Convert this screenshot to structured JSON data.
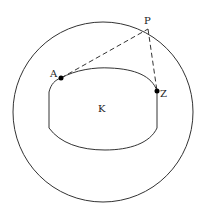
{
  "diagram": {
    "labels": {
      "P": "P",
      "A": "A",
      "Z": "Z",
      "K": "K"
    },
    "colors": {
      "stroke": "#333333",
      "point": "#000000",
      "background": "#ffffff"
    }
  }
}
